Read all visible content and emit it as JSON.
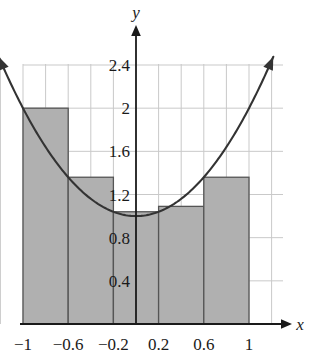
{
  "chart_data": {
    "type": "bar",
    "title": "",
    "subtitle": "",
    "xlabel": "x",
    "ylabel": "y",
    "xlim": [
      -1.28,
      1.28
    ],
    "ylim": [
      0,
      2.62
    ],
    "grid": true,
    "legend": null,
    "x_ticks": [
      {
        "value": -1,
        "label": "−1"
      },
      {
        "value": -0.6,
        "label": "−0.6"
      },
      {
        "value": -0.2,
        "label": "−0.2"
      },
      {
        "value": 0.2,
        "label": "0.2"
      },
      {
        "value": 0.6,
        "label": "0.6"
      },
      {
        "value": 1,
        "label": "1"
      }
    ],
    "y_ticks": [
      {
        "value": 0.4,
        "label": "0.4"
      },
      {
        "value": 0.8,
        "label": "0.8"
      },
      {
        "value": 1.2,
        "label": "1.2"
      },
      {
        "value": 1.6,
        "label": "1.6"
      },
      {
        "value": 2.0,
        "label": "2"
      },
      {
        "value": 2.4,
        "label": "2.4"
      }
    ],
    "x_gridlines": [
      -1.2,
      -1.0,
      -0.8,
      -0.6,
      -0.4,
      -0.2,
      0.2,
      0.4,
      0.6,
      0.8,
      1.0,
      1.2
    ],
    "y_gridlines": [
      0.4,
      0.8,
      1.2,
      1.6,
      2.0,
      2.4
    ],
    "bars": {
      "count": 5,
      "width": 0.4,
      "edges": [
        -1.0,
        -0.6,
        -0.2,
        0.2,
        0.6,
        1.0
      ],
      "categories": [
        "[-1, -0.6]",
        "[-0.6, -0.2]",
        "[-0.2, 0.2]",
        "[0.2, 0.6]",
        "[0.6, 1]"
      ],
      "values": [
        2.0,
        1.36,
        1.04,
        1.09,
        1.36
      ],
      "fill_color": "#b0b0b0",
      "edge_color": "#555555"
    },
    "curve": {
      "label": "",
      "expression_y_of_x": "1 + x^2",
      "color": "#333333",
      "x_start": -1.26,
      "x_end": 1.26,
      "arrow_both_ends": true,
      "points": [
        {
          "x": -1.26,
          "y": 2.588
        },
        {
          "x": -1.0,
          "y": 2.0
        },
        {
          "x": -0.8,
          "y": 1.64
        },
        {
          "x": -0.6,
          "y": 1.36
        },
        {
          "x": -0.4,
          "y": 1.16
        },
        {
          "x": -0.2,
          "y": 1.04
        },
        {
          "x": 0.0,
          "y": 1.0
        },
        {
          "x": 0.2,
          "y": 1.04
        },
        {
          "x": 0.4,
          "y": 1.16
        },
        {
          "x": 0.6,
          "y": 1.36
        },
        {
          "x": 0.8,
          "y": 1.64
        },
        {
          "x": 1.0,
          "y": 2.0
        },
        {
          "x": 1.26,
          "y": 2.588
        }
      ]
    },
    "colors": {
      "grid": "#c9c9c9",
      "axis": "#1a1a1a",
      "bar_fill": "#b0b0b0",
      "bar_edge": "#555555",
      "curve": "#333333",
      "text": "#1a1a1a",
      "background": "#ffffff"
    }
  }
}
